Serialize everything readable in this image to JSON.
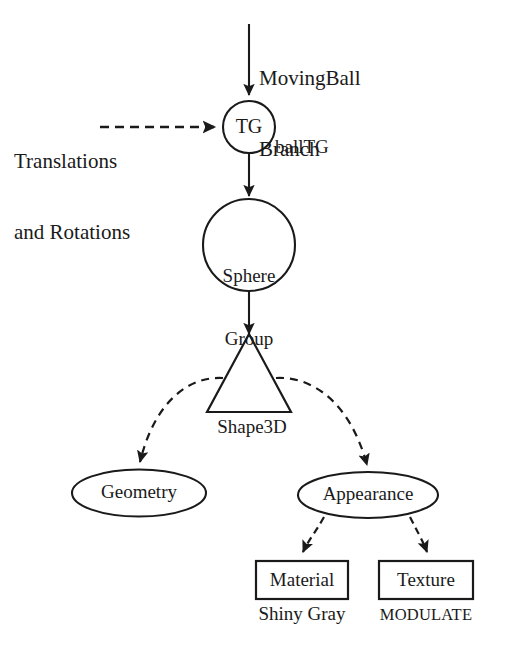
{
  "diagram": {
    "background_color": "#ffffff",
    "stroke_color": "#1a1a1a",
    "nodes": [
      {
        "id": "moving-ball-branch",
        "label_line1": "MovingBall",
        "label_line2": "Branch",
        "shape": "text",
        "interactable": false
      },
      {
        "id": "translations-rotations",
        "label_line1": "Translations",
        "label_line2": "and Rotations",
        "shape": "text",
        "interactable": false
      },
      {
        "id": "tg",
        "label": "TG",
        "side_label": "ballTG",
        "shape": "circle"
      },
      {
        "id": "sphere-group",
        "label_line1": "Sphere",
        "label_line2": "Group",
        "shape": "circle"
      },
      {
        "id": "shape3d",
        "label": "Shape3D",
        "shape": "triangle"
      },
      {
        "id": "geometry",
        "label": "Geometry",
        "shape": "ellipse"
      },
      {
        "id": "appearance",
        "label": "Appearance",
        "shape": "ellipse"
      },
      {
        "id": "material",
        "label": "Material",
        "caption": "Shiny Gray",
        "shape": "rectangle"
      },
      {
        "id": "texture",
        "label": "Texture",
        "caption": "MODULATE",
        "shape": "rectangle"
      }
    ],
    "edges": [
      {
        "from": "moving-ball-branch",
        "to": "tg",
        "style": "solid",
        "arrow": true
      },
      {
        "from": "translations-rotations",
        "to": "tg",
        "style": "dashed",
        "arrow": true
      },
      {
        "from": "tg",
        "to": "sphere-group",
        "style": "solid",
        "arrow": true
      },
      {
        "from": "sphere-group",
        "to": "shape3d",
        "style": "solid",
        "arrow": true
      },
      {
        "from": "shape3d",
        "to": "geometry",
        "style": "dashed",
        "arrow": true
      },
      {
        "from": "shape3d",
        "to": "appearance",
        "style": "dashed",
        "arrow": true
      },
      {
        "from": "appearance",
        "to": "material",
        "style": "dashed",
        "arrow": true
      },
      {
        "from": "appearance",
        "to": "texture",
        "style": "dashed",
        "arrow": true
      }
    ]
  }
}
